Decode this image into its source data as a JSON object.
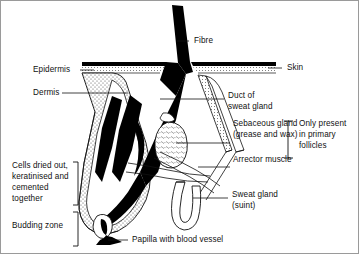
{
  "diagram": {
    "labels": {
      "fibre": "Fibre",
      "skin": "Skin",
      "epidermis": "Epidermis",
      "dermis": "Dermis",
      "duct_of_sweat_gland_line1": "Duct of",
      "duct_of_sweat_gland_line2": "sweat gland",
      "sebaceous_gland_line1": "Sebaceous gland",
      "sebaceous_gland_line2": "(grease and wax)",
      "arrector_muscle": "Arrector muscle",
      "only_present_line1": "Only present",
      "only_present_line2": "in primary",
      "only_present_line3": "follicles",
      "cells_dried_line1": "Cells dried out,",
      "cells_dried_line2": "keratinised and",
      "cells_dried_line3": "cemented",
      "cells_dried_line4": "together",
      "budding_zone": "Budding zone",
      "sweat_gland_line1": "Sweat gland",
      "sweat_gland_line2": "(suint)",
      "papilla": "Papilla with blood vessel"
    },
    "colors": {
      "ink": "#111111",
      "fibre_black": "#000000",
      "stipple": "#5a5a5a",
      "background": "#ffffff",
      "border": "#9a9a9a"
    }
  }
}
